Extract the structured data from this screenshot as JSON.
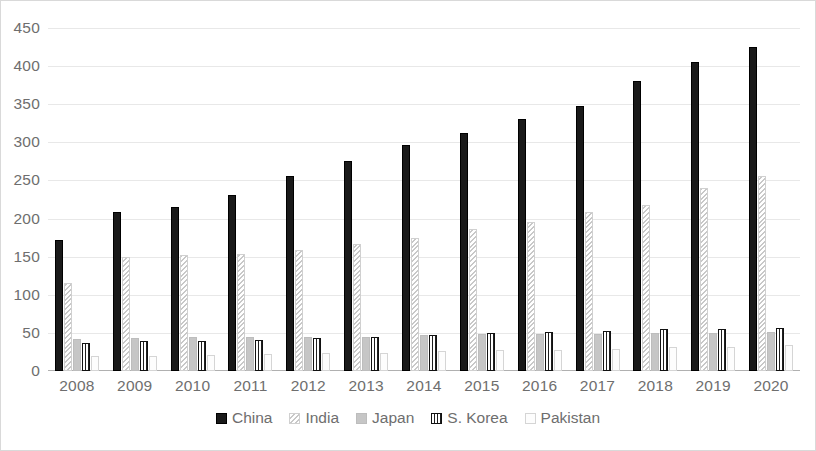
{
  "chart_data": {
    "type": "bar",
    "title": "",
    "subtitle": "",
    "xlabel": "",
    "ylabel": "",
    "ylim": [
      0,
      450
    ],
    "ytick_step": 50,
    "grid": true,
    "legend_position": "bottom",
    "categories": [
      "2008",
      "2009",
      "2010",
      "2011",
      "2012",
      "2013",
      "2014",
      "2015",
      "2016",
      "2017",
      "2018",
      "2019",
      "2020"
    ],
    "yticks": [
      "450",
      "400",
      "350",
      "300",
      "250",
      "200",
      "150",
      "100",
      "50",
      "0"
    ],
    "series": [
      {
        "name": "China",
        "pattern": "solid-black",
        "color": "#1a1a1a",
        "values": [
          172,
          209,
          215,
          231,
          256,
          276,
          297,
          312,
          331,
          348,
          380,
          406,
          425
        ]
      },
      {
        "name": "India",
        "pattern": "diagonal-hatch",
        "color": "#c8c8c8",
        "values": [
          115,
          149,
          152,
          153,
          159,
          166,
          174,
          186,
          196,
          208,
          218,
          240,
          256
        ]
      },
      {
        "name": "Japan",
        "pattern": "solid-gray",
        "color": "#c6c6c6",
        "values": [
          42,
          43,
          44,
          45,
          45,
          45,
          47,
          48,
          49,
          49,
          50,
          50,
          51
        ]
      },
      {
        "name": "S. Korea",
        "pattern": "vertical-stripe",
        "color": "#1f1f1f",
        "values": [
          37,
          39,
          40,
          41,
          43,
          44,
          47,
          50,
          51,
          52,
          55,
          55,
          57
        ]
      },
      {
        "name": "Pakistan",
        "pattern": "empty-white",
        "color": "#fdfdfd",
        "values": [
          20,
          20,
          21,
          22,
          23,
          24,
          26,
          27,
          28,
          29,
          31,
          32,
          34
        ]
      }
    ]
  }
}
